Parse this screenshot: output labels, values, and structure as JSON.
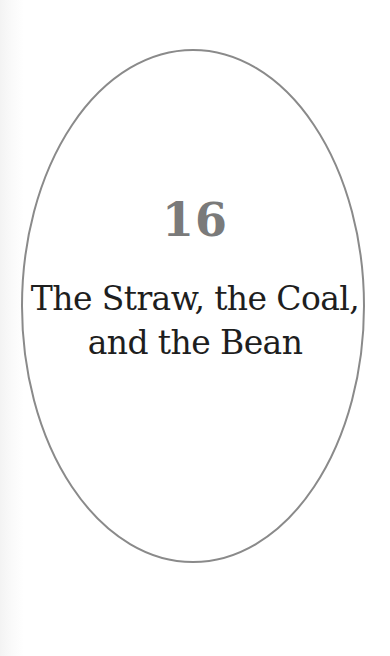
{
  "chapter": {
    "number": "16",
    "title_lines": [
      "The Straw, the Coal,",
      "and the Bean"
    ]
  },
  "style": {
    "ellipse_stroke": "#8a8a8a",
    "number_color": "#7a7a7a",
    "title_color": "#1e1e1e",
    "background": "#ffffff"
  }
}
